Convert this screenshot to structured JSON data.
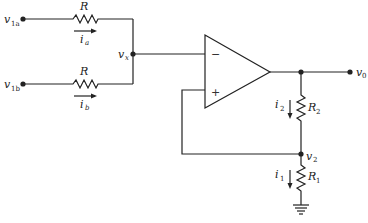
{
  "diagram": {
    "type": "circuit-schematic",
    "inputs": [
      {
        "label": "v",
        "sub": "1a",
        "current": "i",
        "current_sub": "a",
        "resistor": "R"
      },
      {
        "label": "v",
        "sub": "1b",
        "current": "i",
        "current_sub": "b",
        "resistor": "R"
      }
    ],
    "summing_node": {
      "label": "v",
      "sub": "x"
    },
    "opamp": {
      "minus": "−",
      "plus": "+"
    },
    "output": {
      "label": "v",
      "sub": "0"
    },
    "r2": {
      "label": "R",
      "sub": "2",
      "current": "i",
      "current_sub": "2"
    },
    "r1": {
      "label": "R",
      "sub": "1",
      "current": "i",
      "current_sub": "1"
    },
    "divider_node": {
      "label": "v",
      "sub": "2"
    }
  }
}
